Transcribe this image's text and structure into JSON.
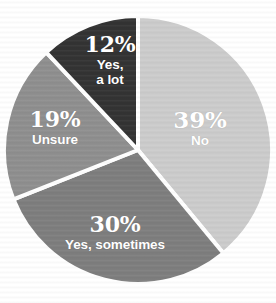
{
  "chart_data": {
    "type": "pie",
    "title": "",
    "subtitle": "",
    "xlabel": "",
    "ylabel": "",
    "legend_position": "none",
    "labels_inside_slices": true,
    "total": 100,
    "units": "%",
    "start_angle_deg": 0,
    "direction": "clockwise",
    "categories": [
      "No",
      "Yes, sometimes",
      "Unsure",
      "Yes, a lot"
    ],
    "values": [
      39,
      30,
      19,
      12
    ],
    "slices": [
      {
        "name": "no-slice",
        "label": "No",
        "value": 39,
        "percent_text": "39%",
        "color": "#cccccc",
        "text_color": "#ffffff",
        "start_deg": 0,
        "end_deg": 140.4
      },
      {
        "name": "yes-sometimes-slice",
        "label": "Yes, sometimes",
        "value": 30,
        "percent_text": "30%",
        "color": "#7e7e7e",
        "text_color": "#ffffff",
        "start_deg": 140.4,
        "end_deg": 248.4
      },
      {
        "name": "unsure-slice",
        "label": "Unsure",
        "value": 19,
        "percent_text": "19%",
        "color": "#8f8f8f",
        "text_color": "#ffffff",
        "start_deg": 248.4,
        "end_deg": 316.8
      },
      {
        "name": "yes-a-lot-slice",
        "label": "Yes, a lot",
        "value": 12,
        "percent_text": "12%",
        "label_line1": "Yes,",
        "label_line2": "a lot",
        "color": "#333333",
        "text_color": "#ffffff",
        "start_deg": 316.8,
        "end_deg": 360
      }
    ],
    "geometry": {
      "center_x": 138,
      "center_y": 150,
      "radius": 134,
      "divider_color": "#ffffff",
      "divider_width": 4
    },
    "background_color": "#ffffff"
  }
}
